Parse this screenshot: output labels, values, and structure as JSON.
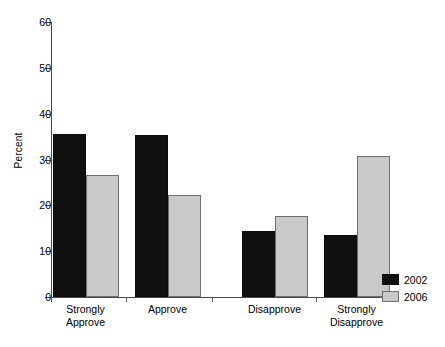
{
  "chart_data": {
    "type": "bar",
    "title": "",
    "xlabel": "",
    "ylabel": "Percent",
    "ylim": [
      0,
      60
    ],
    "yticks": [
      0,
      10,
      20,
      30,
      40,
      50,
      60
    ],
    "ytick_labels": [
      "0",
      "10",
      "20",
      "30",
      "40",
      "50",
      "60"
    ],
    "grid": false,
    "legend_position": "bottom-right",
    "categories": [
      "Strongly\nApprove",
      "Approve",
      "Disapprove",
      "Strongly\nDisapprove"
    ],
    "category_labels": [
      "Strongly Approve",
      "Approve",
      "Disapprove",
      "Strongly Disapprove"
    ],
    "series": [
      {
        "name": "2002",
        "color": "#101010",
        "values": [
          35.5,
          35.4,
          14.4,
          13.5
        ]
      },
      {
        "name": "2006",
        "color": "#c9c9c9",
        "values": [
          26.6,
          22.3,
          17.7,
          30.8
        ]
      }
    ]
  },
  "legend": {
    "entries": [
      {
        "label": "2002",
        "swatch": "black-swatch"
      },
      {
        "label": "2006",
        "swatch": "gray-swatch"
      }
    ]
  }
}
